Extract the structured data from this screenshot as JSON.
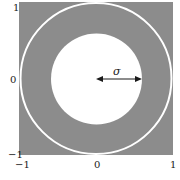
{
  "figure": {
    "type": "annulus-diagram",
    "background_color": "#ffffff",
    "region_color": "#8c8c8c",
    "ring_color": "#ffffff",
    "inner_disk_color": "#ffffff",
    "arrow_color": "#1a1a1a",
    "arrow_label": "σ",
    "outer_radius": 1,
    "inner_radius_sigma": 0.6
  },
  "axes": {
    "y_ticks": [
      {
        "value": 1,
        "label": "1"
      },
      {
        "value": 0,
        "label": "0"
      },
      {
        "value": -1,
        "label": "−1"
      }
    ],
    "x_ticks": [
      {
        "value": -1,
        "label": "−1"
      },
      {
        "value": 0,
        "label": "0"
      },
      {
        "value": 1,
        "label": "1"
      }
    ],
    "xlim": [
      -1,
      1
    ],
    "ylim": [
      -1,
      1
    ]
  }
}
